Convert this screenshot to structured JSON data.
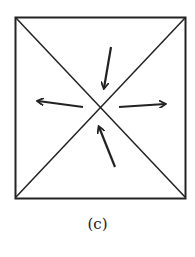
{
  "figure": {
    "caption": "(c)",
    "stroke_color": "#222222",
    "background": "#ffffff"
  },
  "square": {
    "x1": 15,
    "y1": 17,
    "x2": 186,
    "y2": 198
  },
  "arrows": [
    {
      "name": "arrow-down-toward-center",
      "x1": 111,
      "y1": 47,
      "x2": 104,
      "y2": 88
    },
    {
      "name": "arrow-left-outward",
      "x1": 83,
      "y1": 107,
      "x2": 38,
      "y2": 101
    },
    {
      "name": "arrow-right-outward",
      "x1": 119,
      "y1": 107,
      "x2": 165,
      "y2": 104
    },
    {
      "name": "arrow-up-toward-center",
      "x1": 115,
      "y1": 167,
      "x2": 99,
      "y2": 127
    }
  ]
}
